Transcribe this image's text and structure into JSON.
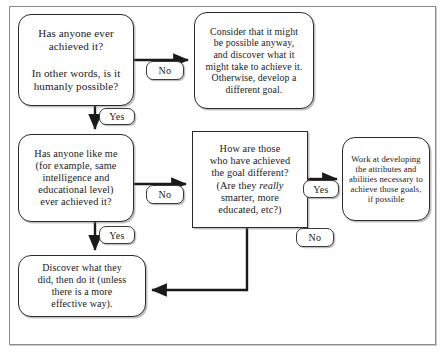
{
  "diagram": {
    "type": "flowchart",
    "nodes": {
      "ever_achieved": {
        "id": "node-ever-achieved",
        "shape": "rounded-rectangle",
        "text": "Has anyone ever\nachieved it?\n\nIn other words, is it\nhumanly possible?"
      },
      "possible_anyway": {
        "id": "node-possible-anyway",
        "shape": "rounded-rectangle",
        "text": "Consider that it might\nbe possible anyway,\nand discover what it\nmight take to achieve it.\nOtherwise, develop a\ndifferent goal."
      },
      "anyone_like_me": {
        "id": "node-anyone-like-me",
        "shape": "rounded-rectangle",
        "text": "Has anyone like me\n(for example, same\nintelligence and\neducational level)\never achieved it?"
      },
      "how_different": {
        "id": "node-how-different",
        "shape": "rectangle",
        "text_before_italic": "How are those\nwho have achieved\nthe goal different?\n(Are they ",
        "italic_word": "really",
        "text_after_italic": "\nsmarter, more\neducated, etc?)"
      },
      "work_developing": {
        "id": "node-work-developing",
        "shape": "rounded-rectangle",
        "text": "Work at developing\nthe attributes and\nabilities necessary to\nachieve those goals,\nif possible"
      },
      "discover": {
        "id": "node-discover",
        "shape": "rounded-rectangle",
        "text": "Discover what they\ndid, then do it (unless\nthere is a more\neffective way)."
      }
    },
    "edge_labels": {
      "no_1": "No",
      "yes_1": "Yes",
      "no_2": "No",
      "yes_2": "Yes",
      "yes_3": "Yes",
      "no_3": "No"
    },
    "colors": {
      "stroke": "#2b2b2b",
      "connector": "#1a1a1a",
      "background": "#ffffff",
      "frame": "#8d8d8d"
    }
  }
}
